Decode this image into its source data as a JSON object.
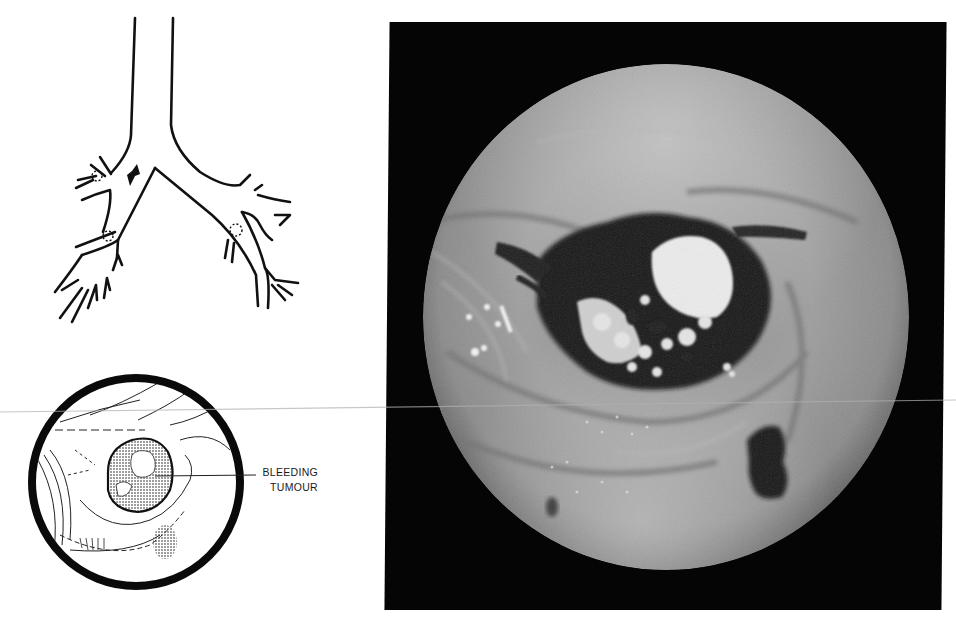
{
  "figure": {
    "panels": [
      {
        "id": "bronchial-tree-diagram",
        "type": "line-drawing",
        "description": "Schematic of trachea and bronchial tree with arrow and dotted circles marking lesion sites"
      },
      {
        "id": "endoscopic-view-sketch",
        "type": "line-drawing",
        "description": "Circular sketch of bronchoscopic view"
      },
      {
        "id": "bronchoscopy-photograph",
        "type": "photograph",
        "description": "Grayscale circular endoscopic photograph on black background"
      }
    ],
    "annotation": {
      "line1": "BLEEDING",
      "line2": "TUMOUR"
    },
    "colors": {
      "ink": "#111111",
      "background": "#ffffff",
      "photo_frame": "#050505",
      "mucosa": "#9a9a9a",
      "tumour_highlight": "#f2f2f2"
    }
  }
}
